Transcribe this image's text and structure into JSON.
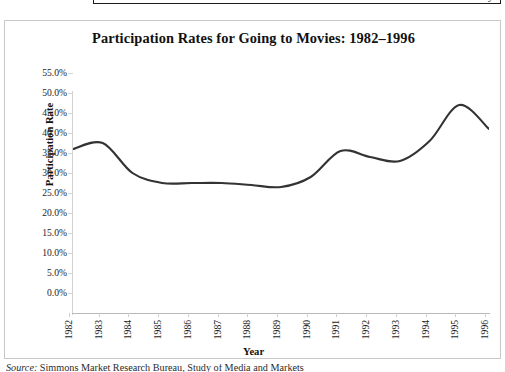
{
  "figure": {
    "title": "Participation Rates for Going to Movies: 1982–1996",
    "x_axis_title": "Year",
    "y_axis_title": "Participation Rate",
    "top_fragment_text": "y",
    "source_lead": "Source:",
    "source_body": " Simmons Market Research Bureau, Study of Media and Markets"
  },
  "chart_data": {
    "type": "line",
    "title": "Participation Rates for Going to Movies: 1982–1996",
    "xlabel": "Year",
    "ylabel": "Participation Rate",
    "xlim": [
      1982,
      1996
    ],
    "ylim": [
      0,
      55
    ],
    "grid": false,
    "legend": "none",
    "line_color": "#333333",
    "line_smoothing": "spline",
    "markers": false,
    "y_tick_labels": [
      "0.0%",
      "5.0%",
      "10.0%",
      "15.0%",
      "20.0%",
      "25.0%",
      "30.0%",
      "35.0%",
      "40.0%",
      "45.0%",
      "50.0%",
      "55.0%"
    ],
    "y_ticks": [
      0,
      5,
      10,
      15,
      20,
      25,
      30,
      35,
      40,
      45,
      50,
      55
    ],
    "categories": [
      "1982",
      "1983",
      "1984",
      "1985",
      "1986",
      "1987",
      "1988",
      "1989",
      "1990",
      "1991",
      "1992",
      "1993",
      "1994",
      "1995",
      "1996"
    ],
    "x": [
      1982,
      1983,
      1984,
      1985,
      1986,
      1987,
      1988,
      1989,
      1990,
      1991,
      1992,
      1993,
      1994,
      1995,
      1996
    ],
    "values": [
      41.0,
      42.5,
      35.0,
      32.5,
      32.5,
      32.5,
      32.0,
      31.5,
      34.0,
      40.5,
      39.0,
      38.0,
      43.0,
      52.0,
      46.0
    ],
    "series": [
      {
        "name": "Participation Rate",
        "values": [
          41.0,
          42.5,
          35.0,
          32.5,
          32.5,
          32.5,
          32.0,
          31.5,
          34.0,
          40.5,
          39.0,
          38.0,
          43.0,
          52.0,
          46.0
        ]
      }
    ]
  }
}
